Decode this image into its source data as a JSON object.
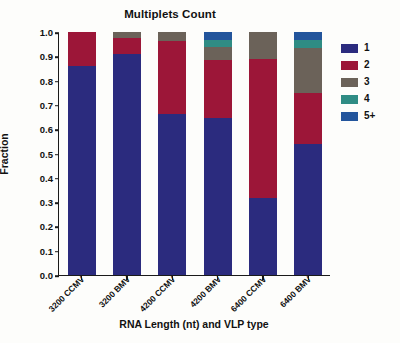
{
  "chart_data": {
    "type": "bar",
    "subtype": "stacked-bar-100-percent",
    "title": "Multiplets Count",
    "xlabel": "RNA Length (nt) and VLP type",
    "ylabel": "Fraction",
    "categories": [
      "3200 CCMV",
      "3200 BMV",
      "4200 CCMV",
      "4200 BMV",
      "6400 CCMV",
      "6400 BMV"
    ],
    "ylim": [
      0.0,
      1.0
    ],
    "yticks": [
      "0.0",
      "0.1",
      "0.2",
      "0.3",
      "0.4",
      "0.5",
      "0.6",
      "0.7",
      "0.8",
      "0.9",
      "1.0"
    ],
    "ytick_values": [
      0.0,
      0.1,
      0.2,
      0.3,
      0.4,
      0.5,
      0.6,
      0.7,
      0.8,
      0.9,
      1.0
    ],
    "grid": false,
    "legend_position": "right",
    "legend_title": "",
    "series": [
      {
        "name": "1",
        "color": "#2b2b7e",
        "values": [
          0.862,
          0.91,
          0.662,
          0.645,
          0.318,
          0.538
        ]
      },
      {
        "name": "2",
        "color": "#9c1638",
        "values": [
          0.138,
          0.065,
          0.3,
          0.24,
          0.57,
          0.21
        ]
      },
      {
        "name": "3",
        "color": "#6b6259",
        "values": [
          0.0,
          0.025,
          0.038,
          0.055,
          0.112,
          0.187
        ]
      },
      {
        "name": "4",
        "color": "#2f8c84",
        "values": [
          0.0,
          0.0,
          0.0,
          0.028,
          0.0,
          0.033
        ]
      },
      {
        "name": "5+",
        "color": "#23559c",
        "values": [
          0.0,
          0.0,
          0.0,
          0.032,
          0.0,
          0.032
        ]
      }
    ]
  },
  "legend": {
    "items": [
      {
        "label": "1",
        "color": "#2b2b7e"
      },
      {
        "label": "2",
        "color": "#9c1638"
      },
      {
        "label": "3",
        "color": "#6b6259"
      },
      {
        "label": "4",
        "color": "#2f8c84"
      },
      {
        "label": "5+",
        "color": "#23559c"
      }
    ]
  }
}
